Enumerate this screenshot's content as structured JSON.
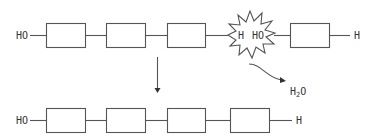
{
  "diagram": {
    "colors": {
      "stroke": "#555555",
      "text": "#333333",
      "background": "#ffffff"
    },
    "top_chain": {
      "left_terminal": "HO",
      "right_terminal": "H",
      "monomer_count": 4
    },
    "reaction_site": {
      "left_label": "H",
      "right_label": "HO",
      "shape": "starburst"
    },
    "byproduct": {
      "label_main": "H",
      "label_sub": "2",
      "label_tail": "O"
    },
    "bottom_chain": {
      "left_terminal": "HO",
      "right_terminal": "H",
      "monomer_count": 4
    }
  }
}
